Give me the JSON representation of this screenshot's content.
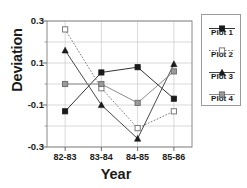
{
  "chart_data": {
    "type": "line",
    "title": "",
    "xlabel": "Year",
    "ylabel": "Deviation",
    "categories": [
      "82-83",
      "83-84",
      "84-85",
      "85-86"
    ],
    "ylim": [
      -0.3,
      0.3
    ],
    "yticks": [
      0.3,
      0.1,
      -0.1,
      -0.3
    ],
    "ytick_labels": [
      "0.3",
      "0.1",
      "-0.1",
      "-0.3"
    ],
    "yticks_minor": [
      0.2,
      0.0,
      -0.2
    ],
    "grid": true,
    "legend_position": "right-outside",
    "series": [
      {
        "name": "Plot 1",
        "values": [
          -0.13,
          0.055,
          0.08,
          -0.07
        ],
        "marker": "filled-square",
        "line": "solid",
        "color": "#333333"
      },
      {
        "name": "Plot 2",
        "values": [
          0.26,
          -0.02,
          -0.21,
          -0.13
        ],
        "marker": "open-square",
        "line": "dotted",
        "color": "#777777"
      },
      {
        "name": "Plot 3",
        "values": [
          0.16,
          -0.1,
          -0.26,
          0.095
        ],
        "marker": "filled-triangle",
        "line": "solid",
        "color": "#4a4a4a"
      },
      {
        "name": "Plot 4",
        "values": [
          0.0,
          0.0,
          -0.09,
          0.06
        ],
        "marker": "gray-square",
        "line": "solid",
        "color": "#8c8c8c"
      }
    ]
  },
  "axes": {
    "y_title": "Deviation",
    "x_title": "Year"
  },
  "legend": {
    "entries": [
      {
        "label": "Plot 1"
      },
      {
        "label": "Plot 2"
      },
      {
        "label": "Plot 3"
      },
      {
        "label": "Plot 4"
      }
    ]
  }
}
